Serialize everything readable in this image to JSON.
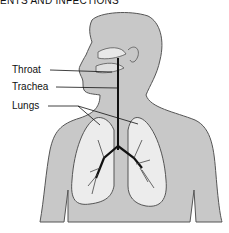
{
  "heading": "ENTS AND INFECTIONS",
  "diagram": {
    "labels": [
      {
        "text": "Throat"
      },
      {
        "text": "Trachea"
      },
      {
        "text": "Lungs"
      }
    ],
    "colors": {
      "body_fill": "#c8c8c8",
      "outline": "#555555",
      "lung_fill": "#ececec",
      "airway": "#111111"
    }
  }
}
